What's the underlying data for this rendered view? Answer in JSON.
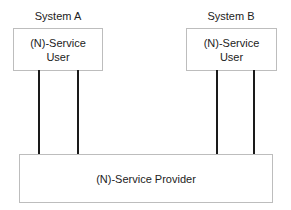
{
  "diagram": {
    "system_a": {
      "title": "System A",
      "box_line1": "(N)-Service",
      "box_line2": "User"
    },
    "system_b": {
      "title": "System B",
      "box_line1": "(N)-Service",
      "box_line2": "User"
    },
    "provider": {
      "label": "(N)-Service Provider"
    },
    "colors": {
      "box_border": "#bdbdbd",
      "connector": "#1a1a1a",
      "text": "#222222"
    }
  }
}
